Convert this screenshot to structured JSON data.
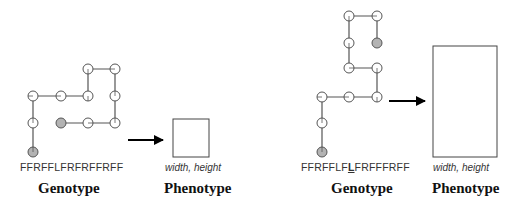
{
  "figures": [
    {
      "genotype": {
        "sequence": "FFRFFLFRFRFFRFF",
        "prefix": "FFRFFLFRFRFFRFF",
        "highlight": "",
        "suffix": "",
        "caption": "Genotype"
      },
      "phenotype": {
        "label": "width, height",
        "caption": "Phenotype"
      },
      "path_nodes": [
        [
          33,
          152
        ],
        [
          33,
          123
        ],
        [
          33,
          96
        ],
        [
          61,
          96
        ],
        [
          88,
          96
        ],
        [
          88,
          69
        ],
        [
          115,
          69
        ],
        [
          115,
          96
        ],
        [
          115,
          123
        ],
        [
          88,
          123
        ],
        [
          61,
          123
        ]
      ],
      "start_node": 0,
      "end_node": 10,
      "arrow": {
        "x1": 128,
        "x2": 163,
        "y": 140
      },
      "box": {
        "x": 173,
        "y": 119,
        "w": 36,
        "h": 38
      }
    },
    {
      "genotype": {
        "sequence": "FFRFFLFLFRFFFRFF",
        "prefix": "FFRFFLF",
        "highlight": "L",
        "suffix": "FRFFFRFF",
        "caption": "Genotype"
      },
      "phenotype": {
        "label": "width, height",
        "caption": "Phenotype"
      },
      "path_nodes": [
        [
          322,
          152
        ],
        [
          322,
          123
        ],
        [
          322,
          97
        ],
        [
          349,
          97
        ],
        [
          377,
          97
        ],
        [
          377,
          68
        ],
        [
          349,
          68
        ],
        [
          349,
          43
        ],
        [
          349,
          16
        ],
        [
          377,
          16
        ],
        [
          377,
          43
        ]
      ],
      "start_node": 0,
      "end_node": 10,
      "arrow": {
        "x1": 389,
        "x2": 425,
        "y": 101
      },
      "box": {
        "x": 433,
        "y": 46,
        "w": 64,
        "h": 111
      }
    }
  ],
  "colors": {
    "line": "#555555",
    "node_fill": "#ffffff",
    "endpoint_fill": "#b3b3b3",
    "arrow": "#000000",
    "box_stroke": "#444444"
  }
}
